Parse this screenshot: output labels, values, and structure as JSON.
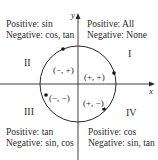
{
  "diagram": {
    "type": "unit-circle-quadrant-signs",
    "axes": {
      "x_label": "x",
      "y_label": "y"
    },
    "quadrants": [
      {
        "numeral": "I",
        "positive": "Positive: All",
        "negative": "Negative: None",
        "sign_pair": "(+, +)"
      },
      {
        "numeral": "II",
        "positive": "Positive: sin",
        "negative": "Negative: cos, tan",
        "sign_pair": "(−, +)"
      },
      {
        "numeral": "III",
        "positive": "Positive: tan",
        "negative": "Negative: sin, cos",
        "sign_pair": "(−, −)"
      },
      {
        "numeral": "IV",
        "positive": "Positive: cos",
        "negative": "Negative: sin, tan",
        "sign_pair": "(+, −)"
      }
    ],
    "colors": {
      "line": "#2a2a2a",
      "background": "#ffffff",
      "point": "#111111"
    }
  }
}
